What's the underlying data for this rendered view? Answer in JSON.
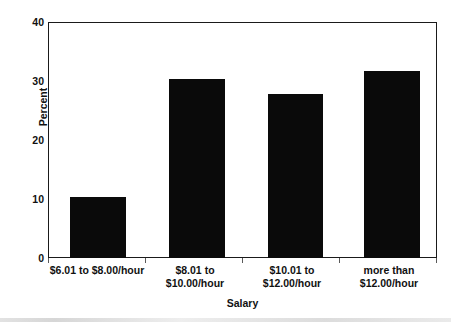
{
  "chart_data": {
    "type": "bar",
    "title": "",
    "xlabel": "Salary",
    "ylabel": "Percent",
    "categories": [
      "$6.01 to $8.00/hour",
      "$8.01 to\n$10.00/hour",
      "$10.01 to\n$12.00/hour",
      "more than\n$12.00/hour"
    ],
    "values": [
      10.4,
      30.4,
      27.8,
      31.7
    ],
    "ylim": [
      0,
      40
    ],
    "yticks": [
      0,
      10,
      20,
      30,
      40
    ],
    "ytick_labels": [
      "0",
      "10",
      "20",
      "30",
      "40"
    ],
    "grid": false,
    "legend": false,
    "bar_color": "#0a0a0a"
  },
  "axes": {
    "y_title": "Percent",
    "x_title": "Salary",
    "y_ticks": [
      {
        "label": "40",
        "value": 40
      },
      {
        "label": "30",
        "value": 30
      },
      {
        "label": "20",
        "value": 20
      },
      {
        "label": "10",
        "value": 10
      },
      {
        "label": "0",
        "value": 0
      }
    ]
  },
  "bars": [
    {
      "label_line1": "$6.01 to $8.00/hour",
      "label_line2": "",
      "value": 10.4
    },
    {
      "label_line1": "$8.01 to",
      "label_line2": "$10.00/hour",
      "value": 30.4
    },
    {
      "label_line1": "$10.01 to",
      "label_line2": "$12.00/hour",
      "value": 27.8
    },
    {
      "label_line1": "more than",
      "label_line2": "$12.00/hour",
      "value": 31.7
    }
  ]
}
